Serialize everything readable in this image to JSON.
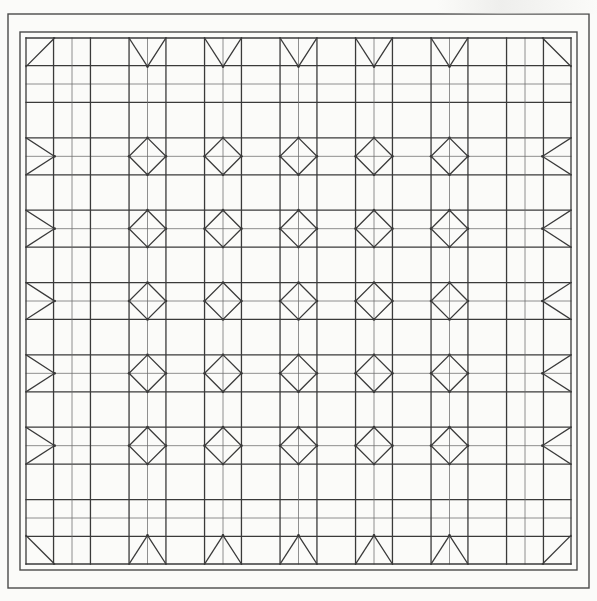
{
  "figure": {
    "kind": "technical-line-drawing",
    "background_color": "#fbfbf9",
    "line_color": "#3a3a3a",
    "thin_line_color": "#6b6b6b",
    "frame_color": "#4a4a4a",
    "canvas": {
      "width": 597,
      "height": 601
    }
  },
  "frame": {
    "outer": {
      "x": 8,
      "y": 14,
      "width": 581,
      "height": 574,
      "stroke_width": 1.4
    },
    "inner": {
      "x": 20,
      "y": 32,
      "width": 557,
      "height": 538,
      "stroke_width": 1.4
    },
    "band_label": "border-band"
  },
  "grid": {
    "field": {
      "x": 26,
      "y": 32,
      "width": 545,
      "height": 538
    },
    "columns": 7,
    "rows": 7,
    "cell_width": 68.5,
    "cell_height": 67.5,
    "block_origin_x": 26,
    "block_origin_y": 32,
    "major_stroke_width": 1.3,
    "minor_stroke_width": 0.75,
    "inset_ratio": 0.26,
    "band_ratio": 0.16
  },
  "motifs": {
    "interior": {
      "name": "square-in-square-diamond",
      "count": 36,
      "description": "Diamond inscribed in a square cell with surrounding double rails"
    },
    "top_border": {
      "name": "v-half-diamond",
      "count": 7,
      "description": "Downward V formed by two diagonals meeting at cell base"
    },
    "bottom_border": {
      "name": "a-half-diamond",
      "count": 7,
      "description": "Upward chevron mirrored from top border"
    },
    "left_border": {
      "name": "left-half-diamond",
      "count": 7,
      "description": "Sideways chevron pointing right"
    },
    "right_border": {
      "name": "right-half-diamond",
      "count": 7,
      "description": "Sideways chevron pointing left"
    },
    "corners": {
      "name": "corner-diagonal",
      "count": 4,
      "description": "Single diagonal line across the corner cell"
    }
  },
  "chart_data": {
    "type": "table",
    "xlabel": "",
    "ylabel": "",
    "categories": [
      "col1",
      "col2",
      "col3",
      "col4",
      "col5",
      "col6",
      "col7"
    ],
    "values": [
      7,
      7,
      7,
      7,
      7,
      7,
      7
    ],
    "grid": true,
    "legend": "none"
  }
}
